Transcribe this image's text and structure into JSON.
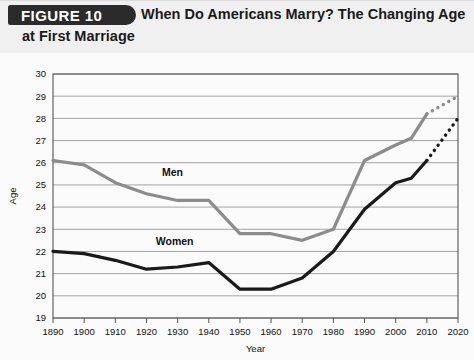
{
  "header": {
    "badge": "FIGURE 10",
    "title_line1": "When Do Americans Marry? The Changing Age",
    "title_line2": "at First Marriage"
  },
  "colors": {
    "men": "#8c8c8c",
    "women": "#1a1a1a",
    "grid": "#9a9a9a",
    "frame": "#555555",
    "badge_bg": "#2b2b2b",
    "header_bg": "#f0f0f0"
  },
  "chart_data": {
    "type": "line",
    "title": "When Do Americans Marry? The Changing Age at First Marriage",
    "xlabel": "Year",
    "ylabel": "Age",
    "x": [
      1890,
      1900,
      1910,
      1920,
      1930,
      1940,
      1950,
      1960,
      1970,
      1980,
      1990,
      2000,
      2010,
      2020
    ],
    "xticklabels": [
      "1890",
      "1900",
      "1910",
      "1920",
      "1930",
      "1940",
      "1950",
      "1960",
      "1970",
      "1980",
      "1990",
      "2000",
      "2010",
      "2020"
    ],
    "yticklabels": [
      "19",
      "20",
      "21",
      "22",
      "23",
      "24",
      "25",
      "26",
      "27",
      "28",
      "29",
      "30"
    ],
    "xlim": [
      1890,
      2020
    ],
    "ylim": [
      19,
      30
    ],
    "grid": true,
    "legend": "inline-labels",
    "series": [
      {
        "name": "Men",
        "color": "#8c8c8c",
        "style": "solid",
        "label_x": 1925,
        "label_y": 25.4,
        "x": [
          1890,
          1900,
          1910,
          1920,
          1930,
          1940,
          1950,
          1960,
          1970,
          1980,
          1990,
          2000,
          2005,
          2010
        ],
        "values": [
          26.1,
          25.9,
          25.1,
          24.6,
          24.3,
          24.3,
          22.8,
          22.8,
          22.5,
          23.0,
          26.1,
          26.8,
          27.1,
          28.2
        ]
      },
      {
        "name": "Men (projected)",
        "color": "#8c8c8c",
        "style": "dotted",
        "x": [
          2010,
          2020
        ],
        "values": [
          28.2,
          29.0
        ]
      },
      {
        "name": "Women",
        "color": "#1a1a1a",
        "style": "solid",
        "label_x": 1923,
        "label_y": 22.3,
        "x": [
          1890,
          1900,
          1910,
          1920,
          1930,
          1940,
          1950,
          1960,
          1970,
          1980,
          1990,
          2000,
          2005,
          2010
        ],
        "values": [
          22.0,
          21.9,
          21.6,
          21.2,
          21.3,
          21.5,
          20.3,
          20.3,
          20.8,
          22.0,
          23.9,
          25.1,
          25.3,
          26.1
        ]
      },
      {
        "name": "Women (projected)",
        "color": "#1a1a1a",
        "style": "dotted",
        "x": [
          2010,
          2020
        ],
        "values": [
          26.1,
          28.0
        ]
      }
    ]
  }
}
